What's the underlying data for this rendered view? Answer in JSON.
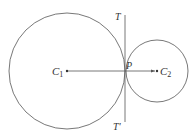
{
  "diagram": {
    "colors": {
      "stroke": "#555555",
      "text": "#333333",
      "background": "#ffffff"
    },
    "circles": [
      {
        "name": "C1",
        "cx": 67,
        "cy": 71,
        "r": 58
      },
      {
        "name": "C2",
        "cx": 157,
        "cy": 71,
        "r": 31
      }
    ],
    "tangent_line": {
      "x": 125,
      "y1": 15,
      "y2": 122
    },
    "center_line": {
      "x1": 67,
      "y1": 71,
      "x2": 157,
      "y2": 71
    },
    "labels": {
      "c1_main": "C",
      "c1_sub": "1",
      "c2_main": "C",
      "c2_sub": "2",
      "point_p": "P",
      "tangent_top": "T",
      "tangent_bottom": "T'"
    }
  }
}
